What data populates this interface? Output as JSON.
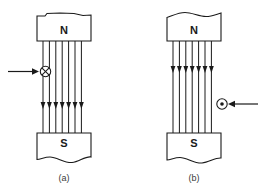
{
  "figure": {
    "background_color": "#ffffff",
    "ink_color": "#1a1a1a",
    "width": 266,
    "height": 193
  },
  "panels": [
    {
      "id": "a",
      "caption": "(a)",
      "caption_x": 64,
      "caption_y": 179,
      "north_pole": {
        "label": "N",
        "label_x": 64,
        "label_y": 31,
        "x": 37,
        "y": 12,
        "width": 54,
        "height": 29,
        "broken_edge": "top",
        "broken_edge_style": "slight-notch"
      },
      "south_pole": {
        "label": "S",
        "label_x": 64,
        "label_y": 144,
        "x": 37,
        "y": 133,
        "width": 54,
        "height": 29,
        "broken_edge": "bottom",
        "broken_edge_style": "wavy"
      },
      "field_lines": {
        "count": 7,
        "direction": "downward",
        "x_start": 43,
        "x_spacing": 6.4,
        "y_top": 41,
        "y_bottom": 133,
        "arrowhead_y": 106
      },
      "current_symbol": {
        "type": "into-page",
        "glyph": "circle-cross",
        "cx": 45.5,
        "cy": 71.5,
        "r": 5.2,
        "meaning": "current into page"
      },
      "force_arrow": {
        "direction": "right",
        "x_start": 8,
        "x_end": 38,
        "y": 71.5
      }
    },
    {
      "id": "b",
      "caption": "(b)",
      "caption_x": 194,
      "caption_y": 179,
      "north_pole": {
        "label": "N",
        "label_x": 194,
        "label_y": 31,
        "x": 167,
        "y": 12,
        "width": 54,
        "height": 29,
        "broken_edge": "top",
        "broken_edge_style": "wavy"
      },
      "south_pole": {
        "label": "S",
        "label_x": 194,
        "label_y": 144,
        "x": 167,
        "y": 133,
        "width": 54,
        "height": 29,
        "broken_edge": "bottom",
        "broken_edge_style": "wavy"
      },
      "field_lines": {
        "count": 7,
        "direction": "downward",
        "x_start": 173,
        "x_spacing": 6.4,
        "y_top": 41,
        "y_bottom": 133,
        "arrowhead_y": 70
      },
      "current_symbol": {
        "type": "out-of-page",
        "glyph": "circle-dot",
        "cx": 222,
        "cy": 104,
        "r": 5.2,
        "meaning": "current out of page"
      },
      "force_arrow": {
        "direction": "left",
        "x_start": 258,
        "x_end": 229,
        "y": 104
      }
    }
  ]
}
